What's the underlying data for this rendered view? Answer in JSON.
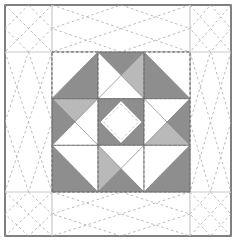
{
  "document": {
    "title": "Quilt Block Diagram",
    "type": "quilt-block-piecing-diagram",
    "canvas": {
      "width": 237,
      "height": 251
    },
    "background_color": "#ffffff"
  },
  "palette": {
    "background": "#ffffff",
    "fabric_white": "#ffffff",
    "fabric_dark_gray": "#8e8e8e",
    "fabric_light_gray": "#b9b9b9",
    "patch_outline": "#6b6b6b",
    "frame_border": "#4a4a4a",
    "grid_line": "#c9c9c9",
    "quilting_dash": "#a9a9a9"
  },
  "frame": {
    "name": "outer-quilt-border",
    "x": 5,
    "y": 5,
    "width": 226,
    "height": 231,
    "stroke": "#4a4a4a",
    "stroke_width": 1.4,
    "fill": "#ffffff"
  },
  "grid": {
    "name": "sashing-grid",
    "vertical_lines": [
      52,
      190
    ],
    "horizontal_lines": [
      52,
      192
    ],
    "stroke": "#c9c9c9",
    "stroke_width": 1.2
  },
  "quilting": {
    "name": "diagonal-quilting-stitches",
    "stroke": "#a9a9a9",
    "stroke_width": 0.8,
    "dash_pattern": "2.6 2.6",
    "description": "Dashed diagonal X quilting in every grid cell"
  },
  "block": {
    "name": "center-pieced-block",
    "x": 52,
    "y": 52,
    "width": 138,
    "height": 140,
    "rows": 3,
    "cols": 3,
    "cell_width": 46,
    "cell_height": 46.67,
    "outline_dash": "2.4 2.4",
    "outline_stroke": "#6b6b6b"
  },
  "units": [
    {
      "id": "unit-r1c1",
      "name": "corner-half-square-triangle-top-left",
      "row": 0,
      "col": 0,
      "type": "half-square-triangle",
      "patches": [
        {
          "name": "patch-white-upper-left",
          "fill": "#ffffff"
        },
        {
          "name": "patch-dark-lower-right",
          "fill": "#8e8e8e"
        }
      ]
    },
    {
      "id": "unit-r1c2",
      "name": "edge-quarter-square-triangle-top",
      "row": 0,
      "col": 1,
      "type": "quarter-square-triangle",
      "patches": [
        {
          "name": "patch-dark-top",
          "fill": "#8e8e8e"
        },
        {
          "name": "patch-light-right",
          "fill": "#b9b9b9"
        },
        {
          "name": "patch-white-left",
          "fill": "#ffffff"
        },
        {
          "name": "patch-white-bottom",
          "fill": "#ffffff"
        }
      ]
    },
    {
      "id": "unit-r1c3",
      "name": "corner-half-square-triangle-top-right",
      "row": 0,
      "col": 2,
      "type": "half-square-triangle",
      "patches": [
        {
          "name": "patch-dark-lower-left",
          "fill": "#8e8e8e"
        },
        {
          "name": "patch-white-upper-right",
          "fill": "#ffffff"
        }
      ]
    },
    {
      "id": "unit-r2c1",
      "name": "edge-quarter-square-triangle-left",
      "row": 1,
      "col": 0,
      "type": "quarter-square-triangle",
      "patches": [
        {
          "name": "patch-dark-left",
          "fill": "#8e8e8e"
        },
        {
          "name": "patch-light-top",
          "fill": "#b9b9b9"
        },
        {
          "name": "patch-white-right",
          "fill": "#ffffff"
        },
        {
          "name": "patch-white-bottom",
          "fill": "#ffffff"
        }
      ]
    },
    {
      "id": "unit-r2c2",
      "name": "center-square-in-a-square",
      "row": 1,
      "col": 1,
      "type": "square-in-a-square",
      "patches": [
        {
          "name": "patch-dark-background-square",
          "fill": "#8e8e8e"
        },
        {
          "name": "patch-white-center-diamond",
          "fill": "#ffffff"
        }
      ]
    },
    {
      "id": "unit-r2c3",
      "name": "edge-quarter-square-triangle-right",
      "row": 1,
      "col": 2,
      "type": "quarter-square-triangle",
      "patches": [
        {
          "name": "patch-dark-right",
          "fill": "#8e8e8e"
        },
        {
          "name": "patch-light-bottom",
          "fill": "#b9b9b9"
        },
        {
          "name": "patch-white-left",
          "fill": "#ffffff"
        },
        {
          "name": "patch-white-top",
          "fill": "#ffffff"
        }
      ]
    },
    {
      "id": "unit-r3c1",
      "name": "corner-half-square-triangle-bottom-left",
      "row": 2,
      "col": 0,
      "type": "half-square-triangle",
      "patches": [
        {
          "name": "patch-dark-upper-right",
          "fill": "#8e8e8e"
        },
        {
          "name": "patch-white-lower-left",
          "fill": "#ffffff"
        }
      ]
    },
    {
      "id": "unit-r3c2",
      "name": "edge-quarter-square-triangle-bottom",
      "row": 2,
      "col": 1,
      "type": "quarter-square-triangle",
      "patches": [
        {
          "name": "patch-dark-bottom",
          "fill": "#8e8e8e"
        },
        {
          "name": "patch-light-left",
          "fill": "#b9b9b9"
        },
        {
          "name": "patch-white-right",
          "fill": "#ffffff"
        },
        {
          "name": "patch-white-top",
          "fill": "#ffffff"
        }
      ]
    },
    {
      "id": "unit-r3c3",
      "name": "corner-half-square-triangle-bottom-right",
      "row": 2,
      "col": 2,
      "type": "half-square-triangle",
      "patches": [
        {
          "name": "patch-dark-upper-left",
          "fill": "#8e8e8e"
        },
        {
          "name": "patch-white-lower-right",
          "fill": "#ffffff"
        }
      ]
    }
  ]
}
